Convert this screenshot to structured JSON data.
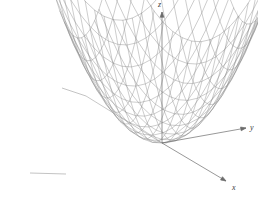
{
  "figure": {
    "title": "",
    "background_color": "#ffffff",
    "width": 258,
    "height": 197
  },
  "axes": {
    "z": {
      "label": "z",
      "icon": "arrow-up-icon",
      "color": "#6b6b6b"
    },
    "y": {
      "label": "y",
      "icon": "arrow-right-icon",
      "color": "#6b6b6b"
    },
    "x": {
      "label": "x",
      "icon": "arrow-down-right-icon",
      "color": "#6b6b6b"
    }
  },
  "chart_data": {
    "type": "surface",
    "title": "",
    "xlabel": "x",
    "ylabel": "y",
    "zlabel": "z",
    "equation": "z = x^2 + y^2",
    "surface_name": "elliptic-paraboloid",
    "projection": "3d-wireframe",
    "mesh": {
      "u_divisions": 18,
      "v_divisions": 18,
      "u_range": [
        -1,
        1
      ],
      "v_range": [
        -1,
        1
      ],
      "line_color": "#8a8a8a",
      "line_width": 0.45,
      "fill": "none"
    },
    "view": {
      "origin_px": [
        162,
        143
      ],
      "z_axis_tip_px": [
        162,
        12
      ],
      "y_axis_tip_px": [
        246,
        128
      ],
      "x_axis_tip_px": [
        226,
        181
      ],
      "neg_y_axis_px": [
        [
          62,
          88
        ],
        [
          86,
          96
        ]
      ],
      "neg_x_axis_px": [
        [
          30,
          173
        ],
        [
          66,
          174
        ]
      ],
      "scale_x": 86,
      "scale_y": 40,
      "scale_z": 112,
      "tilt": 0.27
    },
    "xlim": [
      -1,
      1
    ],
    "ylim": [
      -1,
      1
    ],
    "zlim": [
      0,
      2
    ],
    "grid": false,
    "legend": false
  }
}
